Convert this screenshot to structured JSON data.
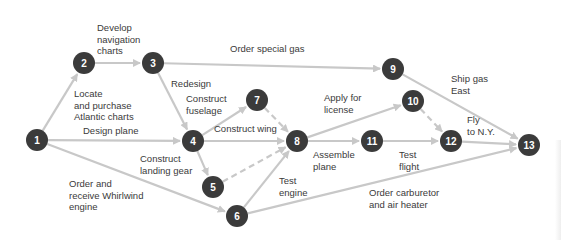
{
  "diagram": {
    "type": "activity-on-arrow network",
    "colors": {
      "node_fill": "#3b3b3b",
      "node_text": "#ffffff",
      "arrow": "#c8c8c8",
      "label_text": "#3a3a3a"
    },
    "nodes": [
      {
        "id": "1",
        "x": 37,
        "y": 140
      },
      {
        "id": "2",
        "x": 84,
        "y": 63
      },
      {
        "id": "3",
        "x": 153,
        "y": 63
      },
      {
        "id": "4",
        "x": 193,
        "y": 141
      },
      {
        "id": "5",
        "x": 213,
        "y": 187
      },
      {
        "id": "6",
        "x": 237,
        "y": 216
      },
      {
        "id": "7",
        "x": 257,
        "y": 100
      },
      {
        "id": "8",
        "x": 297,
        "y": 141
      },
      {
        "id": "9",
        "x": 393,
        "y": 69
      },
      {
        "id": "10",
        "x": 413,
        "y": 101
      },
      {
        "id": "11",
        "x": 372,
        "y": 141
      },
      {
        "id": "12",
        "x": 451,
        "y": 141
      },
      {
        "id": "13",
        "x": 529,
        "y": 145
      }
    ],
    "edges": [
      {
        "from": "1",
        "to": "2",
        "label": "Locate\nand purchase\nAtlantic charts",
        "dashed": false
      },
      {
        "from": "2",
        "to": "3",
        "label": "Develop\nnavigation\ncharts",
        "dashed": false
      },
      {
        "from": "3",
        "to": "9",
        "label": "Order special gas",
        "dashed": false
      },
      {
        "from": "3",
        "to": "4",
        "label": "Redesign",
        "dashed": false
      },
      {
        "from": "1",
        "to": "4",
        "label": "Design plane",
        "dashed": false
      },
      {
        "from": "1",
        "to": "6",
        "label": "Order and\nreceive Whirlwind\nengine",
        "dashed": false
      },
      {
        "from": "4",
        "to": "7",
        "label": "Construct\nfuselage",
        "dashed": false
      },
      {
        "from": "4",
        "to": "8",
        "label": "Construct wing",
        "dashed": false
      },
      {
        "from": "4",
        "to": "5",
        "label": "Construct\nlanding gear",
        "dashed": false
      },
      {
        "from": "7",
        "to": "8",
        "label": "",
        "dashed": true
      },
      {
        "from": "5",
        "to": "8",
        "label": "",
        "dashed": true
      },
      {
        "from": "6",
        "to": "8",
        "label": "Test\nengine",
        "dashed": false
      },
      {
        "from": "6",
        "to": "13",
        "label": "Order carburetor\nand air heater",
        "dashed": false
      },
      {
        "from": "8",
        "to": "10",
        "label": "Apply for\nlicense",
        "dashed": false
      },
      {
        "from": "8",
        "to": "11",
        "label": "Assemble\nplane",
        "dashed": false
      },
      {
        "from": "11",
        "to": "12",
        "label": "Test\nflight",
        "dashed": false
      },
      {
        "from": "10",
        "to": "12",
        "label": "",
        "dashed": true
      },
      {
        "from": "9",
        "to": "13",
        "label": "Ship gas\nEast",
        "dashed": false
      },
      {
        "from": "12",
        "to": "13",
        "label": "Fly\nto N.Y.",
        "dashed": false
      }
    ],
    "labels": {
      "locate": "Locate\nand purchase\nAtlantic charts",
      "develop": "Develop\nnavigation\ncharts",
      "order_gas": "Order special gas",
      "redesign": "Redesign",
      "design_plane": "Design plane",
      "order_engine": "Order and\nreceive Whirlwind\nengine",
      "fuselage": "Construct\nfuselage",
      "wing": "Construct wing",
      "landing_gear": "Construct\nlanding gear",
      "test_engine": "Test\nengine",
      "carburetor": "Order carburetor\nand air heater",
      "license": "Apply for\nlicense",
      "assemble": "Assemble\nplane",
      "test_flight": "Test\nflight",
      "ship_gas": "Ship gas\nEast",
      "fly": "Fly\nto N.Y."
    }
  }
}
